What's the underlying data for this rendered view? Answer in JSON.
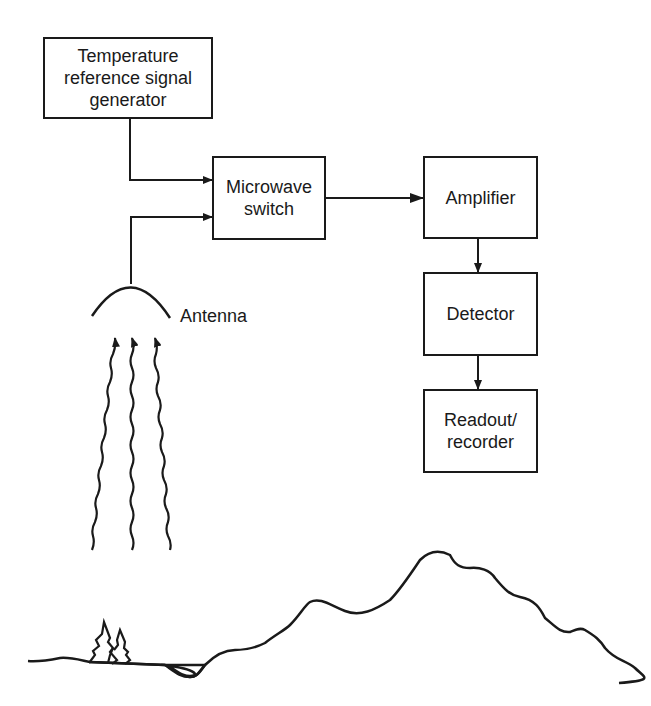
{
  "diagram": {
    "nodes": {
      "temp_ref": "Temperature reference signal generator",
      "switch": "Microwave switch",
      "amplifier": "Amplifier",
      "detector": "Detector",
      "readout": "Readout/ recorder"
    },
    "labels": {
      "antenna": "Antenna"
    },
    "edges": [
      [
        "temp_ref",
        "switch"
      ],
      [
        "antenna",
        "switch"
      ],
      [
        "switch",
        "amplifier"
      ],
      [
        "amplifier",
        "detector"
      ],
      [
        "detector",
        "readout"
      ]
    ]
  }
}
